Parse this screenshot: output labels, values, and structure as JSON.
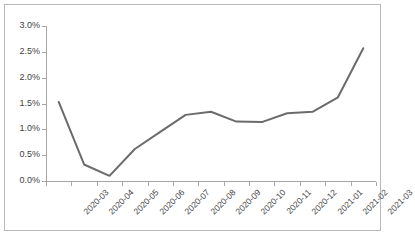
{
  "chart_data": {
    "type": "line",
    "title": "",
    "subtitle": "",
    "xlabel": "",
    "ylabel": "",
    "categories": [
      "2020-03",
      "2020-04",
      "2020-05",
      "2020-06",
      "2020-07",
      "2020-08",
      "2020-09",
      "2020-10",
      "2020-11",
      "2020-12",
      "2021-01",
      "2021-02",
      "2021-03"
    ],
    "values": [
      1.53,
      0.32,
      0.1,
      0.62,
      0.95,
      1.28,
      1.34,
      1.15,
      1.14,
      1.31,
      1.34,
      1.62,
      2.57
    ],
    "series": [
      {
        "name": "",
        "values": [
          1.53,
          0.32,
          0.1,
          0.62,
          0.95,
          1.28,
          1.34,
          1.15,
          1.14,
          1.31,
          1.34,
          1.62,
          2.57
        ]
      }
    ],
    "ylim": [
      0.0,
      3.0
    ],
    "ytick_values": [
      0.0,
      0.5,
      1.0,
      1.5,
      2.0,
      2.5,
      3.0
    ],
    "ytick_labels": [
      "0.0%",
      "0.5%",
      "1.0%",
      "1.5%",
      "2.0%",
      "2.5%",
      "3.0%"
    ],
    "value_unit": "percent",
    "grid": false,
    "legend": false,
    "legend_position": "none",
    "line_color": "#6b6b6b",
    "axis_color": "#a6a6a6",
    "text_color": "#3f3f3f",
    "border_color": "#b9b9b9",
    "background_color": "#ffffff",
    "xtick_label_rotation": -45,
    "markers": false
  }
}
